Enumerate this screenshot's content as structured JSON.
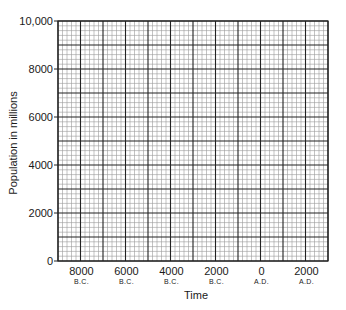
{
  "chart_data": {
    "type": "line",
    "title": "",
    "xlabel": "Time",
    "ylabel": "Population in millions",
    "ylim": [
      0,
      10000
    ],
    "yticks": [
      0,
      2000,
      4000,
      6000,
      8000,
      10000
    ],
    "ytick_labels": [
      "0",
      "2000",
      "4000",
      "6000",
      "8000",
      "10,000"
    ],
    "xlim": [
      -9000,
      2500
    ],
    "xticks": [
      {
        "value": "8000",
        "era": "B.C."
      },
      {
        "value": "6000",
        "era": "B.C."
      },
      {
        "value": "4000",
        "era": "B.C."
      },
      {
        "value": "2000",
        "era": "B.C."
      },
      {
        "value": "0",
        "era": "A.D."
      },
      {
        "value": "2000",
        "era": "A.D."
      }
    ],
    "grid": {
      "enabled": true,
      "major_columns": 12,
      "major_rows": 10,
      "minor_subdivisions": 5
    },
    "series": [],
    "legend": null,
    "note": "Blank graph-paper grid; no data plotted"
  },
  "colors": {
    "major_grid": "#222222",
    "minor_grid": "#9a9a9a",
    "text": "#1a1a1a",
    "background": "#ffffff"
  }
}
